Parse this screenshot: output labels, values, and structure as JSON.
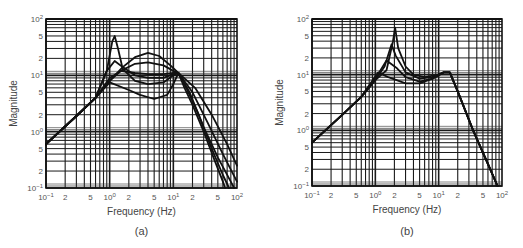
{
  "chart_data": [
    {
      "type": "line",
      "panel_label": "(a)",
      "xlabel": "Frequency (Hz)",
      "ylabel": "Magnitude",
      "xscale": "log",
      "yscale": "log",
      "xlim": [
        0.1,
        100
      ],
      "ylim": [
        0.1,
        100
      ],
      "grid": true,
      "x_ticks": [
        "10-1",
        "2",
        "5",
        "100",
        "2",
        "5",
        "101",
        "2",
        "5",
        "102"
      ],
      "y_ticks": [
        "10-1",
        "2",
        "5",
        "100",
        "2",
        "5",
        "101",
        "2",
        "5",
        "102"
      ],
      "series": [
        {
          "name": "curve-1",
          "points": [
            [
              0.1,
              0.6
            ],
            [
              0.3,
              1.9
            ],
            [
              0.6,
              4
            ],
            [
              0.9,
              12
            ],
            [
              1.1,
              40
            ],
            [
              1.2,
              50
            ],
            [
              1.35,
              30
            ],
            [
              1.6,
              13
            ],
            [
              2.5,
              8
            ],
            [
              4,
              7
            ],
            [
              7,
              7.5
            ],
            [
              10,
              10
            ],
            [
              12,
              11
            ],
            [
              15,
              6
            ],
            [
              20,
              3
            ],
            [
              30,
              1
            ],
            [
              45,
              0.3
            ],
            [
              60,
              0.13
            ],
            [
              65,
              0.1
            ]
          ]
        },
        {
          "name": "curve-2",
          "points": [
            [
              0.1,
              0.6
            ],
            [
              0.3,
              1.9
            ],
            [
              0.6,
              4
            ],
            [
              0.9,
              12
            ],
            [
              1.2,
              18
            ],
            [
              1.6,
              14
            ],
            [
              2.5,
              10
            ],
            [
              4,
              9
            ],
            [
              7,
              9
            ],
            [
              10,
              10.5
            ],
            [
              12,
              11
            ],
            [
              16,
              6
            ],
            [
              25,
              2
            ],
            [
              40,
              0.5
            ],
            [
              60,
              0.17
            ],
            [
              75,
              0.1
            ]
          ]
        },
        {
          "name": "curve-3",
          "points": [
            [
              0.1,
              0.6
            ],
            [
              0.3,
              1.9
            ],
            [
              0.6,
              4
            ],
            [
              1,
              9
            ],
            [
              1.5,
              12
            ],
            [
              2.5,
              11
            ],
            [
              4,
              10.5
            ],
            [
              7,
              10.5
            ],
            [
              10,
              11
            ],
            [
              12,
              11
            ],
            [
              18,
              5
            ],
            [
              30,
              1.2
            ],
            [
              50,
              0.35
            ],
            [
              80,
              0.13
            ],
            [
              90,
              0.1
            ]
          ]
        },
        {
          "name": "curve-4",
          "points": [
            [
              0.1,
              0.6
            ],
            [
              0.3,
              1.9
            ],
            [
              0.6,
              4
            ],
            [
              1,
              8
            ],
            [
              1.5,
              12
            ],
            [
              2.5,
              16
            ],
            [
              4,
              17
            ],
            [
              7,
              15
            ],
            [
              10,
              12
            ],
            [
              12,
              11
            ],
            [
              20,
              5
            ],
            [
              35,
              1.4
            ],
            [
              60,
              0.4
            ],
            [
              100,
              0.13
            ]
          ]
        },
        {
          "name": "curve-5",
          "points": [
            [
              0.1,
              0.6
            ],
            [
              0.3,
              1.9
            ],
            [
              0.6,
              4
            ],
            [
              1,
              8
            ],
            [
              1.6,
              14
            ],
            [
              2.5,
              21
            ],
            [
              4,
              25
            ],
            [
              6,
              22
            ],
            [
              9,
              15
            ],
            [
              12,
              11
            ],
            [
              22,
              6
            ],
            [
              40,
              2
            ],
            [
              70,
              0.6
            ],
            [
              100,
              0.25
            ]
          ]
        },
        {
          "name": "curve-6",
          "points": [
            [
              0.1,
              0.6
            ],
            [
              0.3,
              1.9
            ],
            [
              0.6,
              4
            ],
            [
              1,
              7.5
            ],
            [
              2,
              5.5
            ],
            [
              3,
              4.5
            ],
            [
              5,
              3.8
            ],
            [
              8,
              4.5
            ],
            [
              10,
              7
            ],
            [
              12,
              11
            ]
          ]
        }
      ]
    },
    {
      "type": "line",
      "panel_label": "(b)",
      "xlabel": "Frequency (Hz)",
      "ylabel": "Magnitude",
      "xscale": "log",
      "yscale": "log",
      "xlim": [
        0.1,
        100
      ],
      "ylim": [
        0.1,
        100
      ],
      "grid": true,
      "x_ticks": [
        "10-1",
        "2",
        "5",
        "100",
        "2",
        "5",
        "101",
        "2",
        "5",
        "102"
      ],
      "y_ticks": [
        "10-1",
        "2",
        "5",
        "100",
        "2",
        "5",
        "101",
        "2",
        "5",
        "102"
      ],
      "series": [
        {
          "name": "curve-1",
          "points": [
            [
              0.1,
              0.6
            ],
            [
              0.3,
              1.9
            ],
            [
              0.6,
              4
            ],
            [
              1,
              8
            ],
            [
              1.5,
              12
            ],
            [
              1.9,
              40
            ],
            [
              2.05,
              70
            ],
            [
              2.3,
              30
            ],
            [
              3,
              14
            ],
            [
              4,
              10
            ],
            [
              6,
              9
            ],
            [
              10,
              10
            ],
            [
              12,
              11
            ],
            [
              15,
              11
            ],
            [
              20,
              5
            ],
            [
              35,
              1
            ],
            [
              60,
              0.25
            ],
            [
              85,
              0.1
            ]
          ]
        },
        {
          "name": "curve-2",
          "points": [
            [
              0.1,
              0.6
            ],
            [
              0.3,
              1.9
            ],
            [
              0.6,
              4
            ],
            [
              1,
              8
            ],
            [
              1.4,
              14
            ],
            [
              1.8,
              35
            ],
            [
              2.1,
              22
            ],
            [
              3,
              11
            ],
            [
              5,
              8.5
            ],
            [
              8,
              9
            ],
            [
              12,
              11
            ],
            [
              15,
              11
            ],
            [
              20,
              5
            ],
            [
              35,
              1
            ],
            [
              60,
              0.25
            ],
            [
              85,
              0.1
            ]
          ]
        },
        {
          "name": "curve-3",
          "points": [
            [
              0.1,
              0.6
            ],
            [
              0.3,
              1.9
            ],
            [
              0.6,
              4
            ],
            [
              1,
              8.5
            ],
            [
              1.5,
              18
            ],
            [
              2.2,
              13
            ],
            [
              3,
              9
            ],
            [
              5,
              7.5
            ],
            [
              8,
              8.5
            ],
            [
              12,
              11
            ],
            [
              15,
              11
            ],
            [
              20,
              5
            ],
            [
              35,
              1
            ],
            [
              60,
              0.25
            ],
            [
              85,
              0.1
            ]
          ]
        },
        {
          "name": "curve-4",
          "points": [
            [
              0.1,
              0.6
            ],
            [
              0.3,
              1.9
            ],
            [
              0.6,
              4
            ],
            [
              1.1,
              11
            ],
            [
              1.6,
              9
            ],
            [
              3,
              7
            ],
            [
              5,
              7
            ],
            [
              8,
              8.5
            ],
            [
              12,
              11
            ],
            [
              15,
              11
            ],
            [
              20,
              5
            ],
            [
              35,
              1
            ],
            [
              60,
              0.25
            ],
            [
              85,
              0.1
            ]
          ]
        }
      ]
    }
  ]
}
